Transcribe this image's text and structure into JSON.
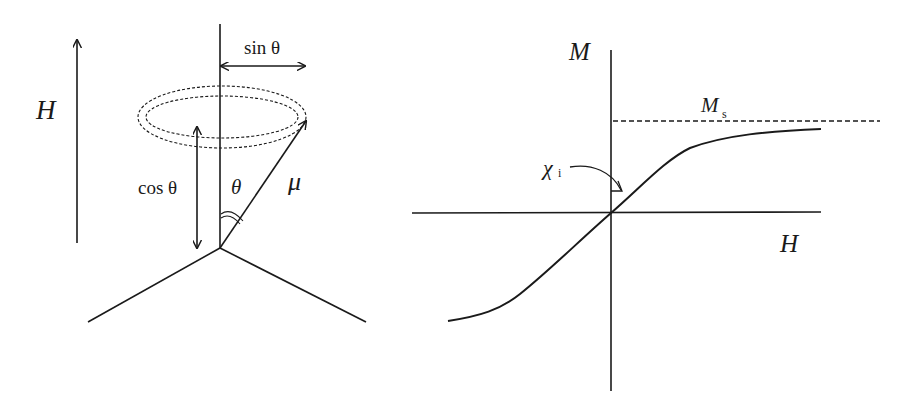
{
  "left_diagram": {
    "field_label": "H",
    "sin_label": "sin θ",
    "cos_label": "cos θ",
    "theta_label": "θ",
    "moment_label": "μ"
  },
  "right_diagram": {
    "y_axis_label": "M",
    "x_axis_label": "H",
    "saturation_label": "M",
    "saturation_sub": "s",
    "susceptibility_label": "χ",
    "susceptibility_sub": "i"
  },
  "colors": {
    "ink": "#1a1a1a",
    "background": "#ffffff"
  }
}
